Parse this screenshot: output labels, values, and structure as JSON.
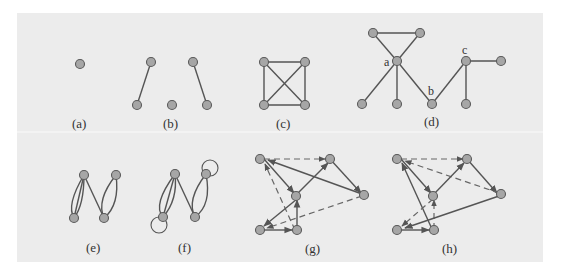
{
  "figure": {
    "background_color": "#ececec",
    "node_fill": "#a6a6a6",
    "node_stroke": "#5a5a5a",
    "edge_color": "#555555"
  },
  "panels": [
    {
      "id": "a",
      "caption": "(a)",
      "description": "single isolated vertex"
    },
    {
      "id": "b",
      "caption": "(b)",
      "description": "five vertices, two edges, one isolated vertex"
    },
    {
      "id": "c",
      "caption": "(c)",
      "description": "complete graph K4 drawn as square with diagonals"
    },
    {
      "id": "d",
      "caption": "(d)",
      "description": "graph with labeled vertices a, b, c",
      "vertex_labels": [
        "a",
        "b",
        "c"
      ]
    },
    {
      "id": "e",
      "caption": "(e)",
      "description": "multigraph with parallel edges"
    },
    {
      "id": "f",
      "caption": "(f)",
      "description": "pseudograph with parallel edges and loops"
    },
    {
      "id": "g",
      "caption": "(g)",
      "description": "directed graph with solid and dashed arcs"
    },
    {
      "id": "h",
      "caption": "(h)",
      "description": "directed graph with solid and dashed arcs"
    }
  ]
}
